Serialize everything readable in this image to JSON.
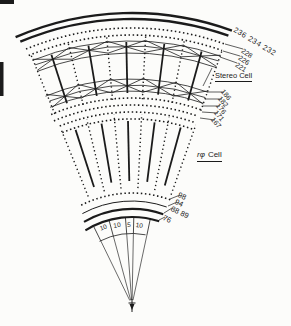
{
  "figure": {
    "labels": {
      "outer_wire_numbers": "236 234 232",
      "stereo_wire_numbers": [
        "228",
        "226",
        "221"
      ],
      "stereo_cell_label": "Stereo Cell",
      "transition_wire_numbers": [
        "186",
        "182",
        "176",
        "171",
        "167"
      ],
      "rphi_cell_symbol": "rφ",
      "rphi_cell_word": "Cell",
      "inner_wire_numbers": [
        "98",
        "94",
        "88 89",
        "76"
      ],
      "cell_width_values": [
        "10",
        "10",
        "5",
        "10"
      ]
    },
    "colors": {
      "ink": "#1b1b1b",
      "paper": "#fcfcfa"
    }
  }
}
